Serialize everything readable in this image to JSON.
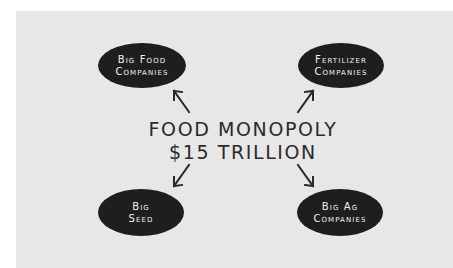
{
  "diagram": {
    "title_line1": "FOOD MONOPOLY",
    "title_line2": "$15 TRILLION",
    "nodes": [
      {
        "id": "big-food",
        "line1": "Big Food",
        "line2": "Companies",
        "position": "top-left"
      },
      {
        "id": "fertilizer",
        "line1": "Fertilizer",
        "line2": "Companies",
        "position": "top-right"
      },
      {
        "id": "big-seed",
        "line1": "Big",
        "line2": "Seed",
        "position": "bottom-left"
      },
      {
        "id": "big-ag",
        "line1": "Big Ag",
        "line2": "Companies",
        "position": "bottom-right"
      }
    ],
    "edges": [
      {
        "from": "center",
        "to": "big-food",
        "direction": "up-left"
      },
      {
        "from": "center",
        "to": "fertilizer",
        "direction": "up-right"
      },
      {
        "from": "center",
        "to": "big-seed",
        "direction": "down-left"
      },
      {
        "from": "center",
        "to": "big-ag",
        "direction": "down-right"
      }
    ],
    "colors": {
      "background": "#e7e7e7",
      "node_fill": "#1e1e1e",
      "node_text": "#f2f2f2",
      "center_text": "#2a2a2a",
      "arrow": "#2a2a2a"
    }
  }
}
